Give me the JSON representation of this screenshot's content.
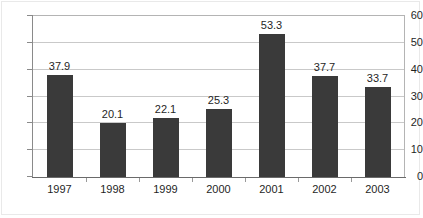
{
  "chart_data": {
    "type": "bar",
    "title": "",
    "subtitle": "",
    "xlabel": "",
    "ylabel": "",
    "categories": [
      "1997",
      "1998",
      "1999",
      "2000",
      "2001",
      "2002",
      "2003"
    ],
    "values": [
      37.9,
      20.1,
      22.1,
      25.3,
      53.3,
      37.7,
      33.7
    ],
    "value_labels": [
      "37.9",
      "20.1",
      "22.1",
      "25.3",
      "53.3",
      "37.7",
      "33.7"
    ],
    "ylim": [
      0,
      60
    ],
    "y_ticks": [
      0,
      10,
      20,
      30,
      40,
      50,
      60
    ],
    "y_tick_labels": [
      "0",
      "10",
      "20",
      "30",
      "40",
      "50",
      "60"
    ],
    "grid": true,
    "grid_axis": "y",
    "legend": false,
    "legend_position": "none",
    "series": [
      {
        "name": "",
        "values": [
          37.9,
          20.1,
          22.1,
          25.3,
          53.3,
          37.7,
          33.7
        ]
      }
    ],
    "colors": {
      "bar_fill": "#3a3a3a",
      "gridline": "#c9c9c9",
      "plot_border": "#b4b4b4",
      "axis": "#6a6a6a",
      "text": "#1f1f1f",
      "background": "#ffffff"
    }
  }
}
